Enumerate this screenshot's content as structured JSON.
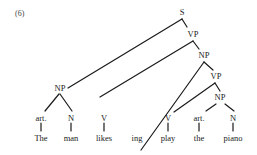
{
  "example_number": "(6)",
  "tree": {
    "root": "S",
    "nodes": {
      "s": "S",
      "vp1": "VP",
      "np_upper": "NP",
      "vp2": "VP",
      "np_inner": "NP",
      "np_subject": "NP",
      "art1": "art.",
      "n1": "N",
      "v1": "V",
      "v2": "V",
      "art2": "art.",
      "n2": "N"
    },
    "leaves": [
      "The",
      "man",
      "likes",
      "ing",
      "play",
      "the",
      "piano"
    ]
  },
  "colors": {
    "line": "#1a1a1a",
    "text": "#222222",
    "background": "#ffffff"
  }
}
